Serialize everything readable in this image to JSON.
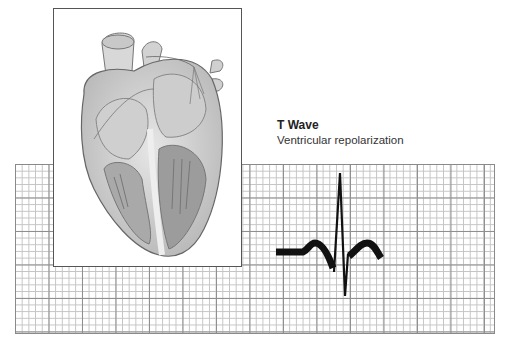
{
  "caption": {
    "title": "T Wave",
    "subtitle": "Ventricular repolarization"
  },
  "figure": {
    "illustration": "heart-cross-section-icon",
    "background": "ecg-grid-paper",
    "trace": "ecg-trace-pqrst",
    "highlighted_segment": "T wave"
  },
  "colors": {
    "trace": "#111111",
    "grid_major": "#8f8f8f",
    "grid_minor": "#c4c4c4",
    "frame": "#555555"
  }
}
